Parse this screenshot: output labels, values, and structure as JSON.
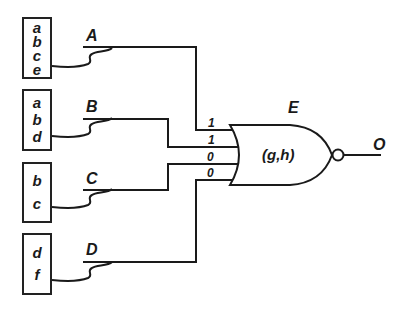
{
  "diagram": {
    "type": "logic-circuit",
    "input_boxes": [
      {
        "id": "box-1",
        "variables": [
          "a",
          "b",
          "c",
          "e"
        ],
        "signal": "A"
      },
      {
        "id": "box-2",
        "variables": [
          "a",
          "b",
          "d"
        ],
        "signal": "B"
      },
      {
        "id": "box-3",
        "variables": [
          "b",
          "c"
        ],
        "signal": "C"
      },
      {
        "id": "box-4",
        "variables": [
          "d",
          "f"
        ],
        "signal": "D"
      }
    ],
    "gate": {
      "type": "NOR",
      "label": "E",
      "function": "(g,h)",
      "input_values": [
        "1",
        "1",
        "0",
        "0"
      ]
    },
    "output": {
      "label": "O"
    },
    "colors": {
      "line": "#1a1a1a",
      "background": "#ffffff"
    }
  }
}
